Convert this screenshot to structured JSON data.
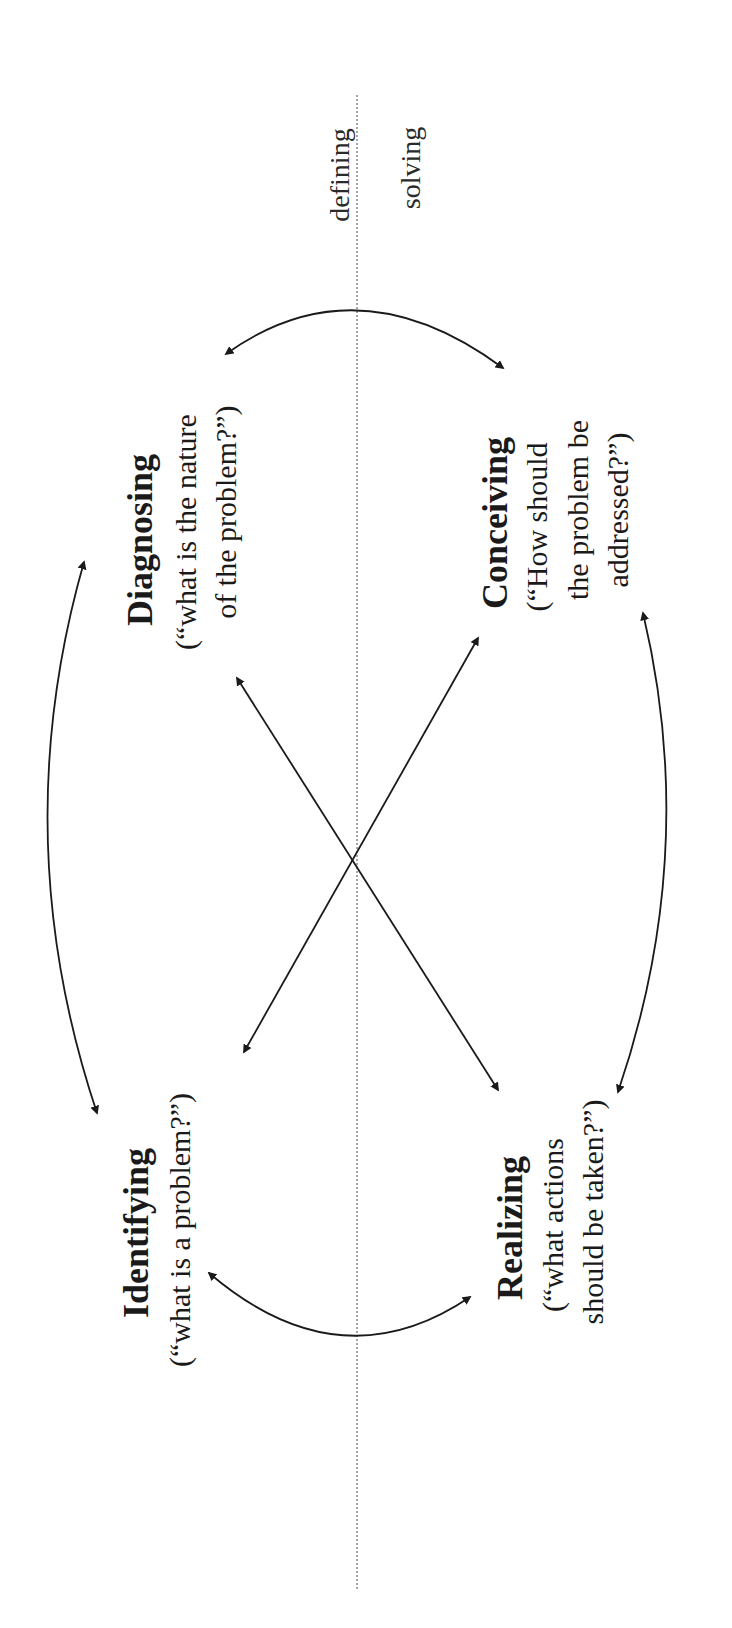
{
  "diagram": {
    "orientation": "rotated 90° counterclockwise",
    "regions": {
      "top": "defining",
      "bottom": "solving"
    },
    "nodes": [
      {
        "id": "identifying",
        "title": "Identifying",
        "question_lines": [
          "(“what is a problem?”)"
        ]
      },
      {
        "id": "diagnosing",
        "title": "Diagnosing",
        "question_lines": [
          "(“what is the nature",
          "of the problem?”)"
        ]
      },
      {
        "id": "conceiving",
        "title": "Conceiving",
        "question_lines": [
          "(“How should",
          "the problem be",
          "addressed?”)"
        ]
      },
      {
        "id": "realizing",
        "title": "Realizing",
        "question_lines": [
          "(“what actions",
          "should be taken?”)"
        ]
      }
    ],
    "edges": [
      {
        "from": "identifying",
        "to": "diagnosing",
        "type": "bidirectional-curved"
      },
      {
        "from": "diagnosing",
        "to": "conceiving",
        "type": "bidirectional-curved"
      },
      {
        "from": "conceiving",
        "to": "realizing",
        "type": "bidirectional-curved"
      },
      {
        "from": "realizing",
        "to": "identifying",
        "type": "bidirectional-curved"
      },
      {
        "from": "identifying",
        "to": "conceiving",
        "type": "bidirectional-straight"
      },
      {
        "from": "diagnosing",
        "to": "realizing",
        "type": "bidirectional-straight"
      }
    ],
    "colors": {
      "ink": "#1a1a1a",
      "divider": "#888888",
      "background": "#ffffff"
    }
  }
}
